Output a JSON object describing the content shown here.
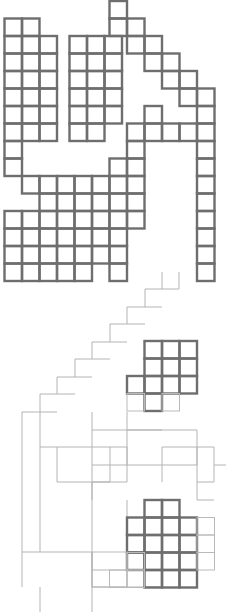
{
  "figure": {
    "type": "grid-diagram",
    "canvas": {
      "width": 226,
      "height": 612,
      "background": "#ffffff"
    },
    "grid": {
      "cell_size": 17.5,
      "origin_x": 4.5,
      "origin_y": 1.0
    },
    "strokes": {
      "thick_color": "#6e6e6e",
      "thick_width": 2.4,
      "thin_color": "#b9b9b9",
      "thin_width": 1.0
    },
    "legend": {
      "thick_label": "dark cell outline",
      "thin_label": "light connector path"
    }
  },
  "chart_data": {
    "type": "heatmap",
    "xlabel": "",
    "ylabel": "",
    "grid": true,
    "legend": "none",
    "cell_size": 17.5,
    "origin": [
      4.5,
      1.0
    ],
    "columns": 13,
    "rows": 35,
    "note": "Cells are addressed by [col,row] on a 17.5px pitch. weight 2 = thick dark outline, weight 1 = thin light outline.",
    "cells_thick": [
      [
        2,
        0
      ],
      [
        6,
        0
      ],
      [
        0,
        1
      ],
      [
        1,
        1
      ],
      [
        2,
        1
      ],
      [
        7,
        1
      ],
      [
        0,
        2
      ],
      [
        1,
        2
      ],
      [
        2,
        2
      ],
      [
        3,
        2
      ],
      [
        8,
        2
      ],
      [
        0,
        3
      ],
      [
        1,
        3
      ],
      [
        2,
        3
      ],
      [
        3,
        3
      ],
      [
        4,
        3
      ],
      [
        5,
        3
      ],
      [
        6,
        3
      ],
      [
        9,
        3
      ],
      [
        0,
        4
      ],
      [
        1,
        4
      ],
      [
        2,
        4
      ],
      [
        3,
        4
      ],
      [
        4,
        4
      ],
      [
        5,
        4
      ],
      [
        6,
        4
      ],
      [
        10,
        4
      ],
      [
        11,
        4
      ],
      [
        0,
        5
      ],
      [
        1,
        5
      ],
      [
        2,
        5
      ],
      [
        3,
        5
      ],
      [
        4,
        5
      ],
      [
        5,
        5
      ],
      [
        6,
        5
      ],
      [
        11,
        5
      ],
      [
        12,
        5
      ],
      [
        3,
        6
      ],
      [
        4,
        6
      ],
      [
        5,
        6
      ],
      [
        6,
        6
      ],
      [
        8,
        6
      ],
      [
        11,
        6
      ],
      [
        12,
        6
      ],
      [
        8,
        7
      ],
      [
        9,
        7
      ],
      [
        10,
        7
      ],
      [
        11,
        7
      ],
      [
        12,
        7
      ],
      [
        0,
        8
      ],
      [
        7,
        8
      ],
      [
        11,
        8
      ],
      [
        0,
        9
      ],
      [
        11,
        9
      ],
      [
        0,
        10
      ],
      [
        1,
        10
      ],
      [
        2,
        10
      ],
      [
        3,
        10
      ],
      [
        4,
        10
      ],
      [
        5,
        10
      ],
      [
        6,
        10
      ],
      [
        7,
        10
      ],
      [
        11,
        10
      ],
      [
        1,
        11
      ],
      [
        2,
        11
      ],
      [
        3,
        11
      ],
      [
        4,
        11
      ],
      [
        5,
        11
      ],
      [
        6,
        11
      ],
      [
        7,
        11
      ],
      [
        11,
        11
      ],
      [
        0,
        12
      ],
      [
        1,
        12
      ],
      [
        2,
        12
      ],
      [
        3,
        12
      ],
      [
        4,
        12
      ],
      [
        5,
        12
      ],
      [
        6,
        12
      ],
      [
        7,
        12
      ],
      [
        11,
        12
      ],
      [
        0,
        13
      ],
      [
        1,
        13
      ],
      [
        2,
        13
      ],
      [
        3,
        13
      ],
      [
        4,
        13
      ],
      [
        5,
        13
      ],
      [
        6,
        13
      ],
      [
        7,
        13
      ],
      [
        11,
        13
      ],
      [
        0,
        14
      ],
      [
        1,
        14
      ],
      [
        2,
        14
      ],
      [
        3,
        14
      ],
      [
        4,
        14
      ],
      [
        5,
        14
      ],
      [
        6,
        14
      ],
      [
        7,
        14
      ],
      [
        11,
        14
      ],
      [
        0,
        15
      ],
      [
        1,
        15
      ],
      [
        2,
        15
      ],
      [
        3,
        15
      ],
      [
        4,
        15
      ],
      [
        5,
        15
      ],
      [
        7,
        15
      ],
      [
        11,
        15
      ],
      [
        8,
        20
      ],
      [
        9,
        20
      ],
      [
        10,
        20
      ],
      [
        8,
        21
      ],
      [
        9,
        21
      ],
      [
        10,
        21
      ],
      [
        7,
        22
      ],
      [
        8,
        22
      ],
      [
        9,
        22
      ],
      [
        10,
        22
      ],
      [
        8,
        23
      ],
      [
        7,
        29
      ],
      [
        8,
        29
      ],
      [
        6,
        30
      ],
      [
        7,
        30
      ],
      [
        8,
        30
      ],
      [
        9,
        30
      ],
      [
        6,
        31
      ],
      [
        7,
        31
      ],
      [
        8,
        31
      ],
      [
        9,
        31
      ],
      [
        6,
        32
      ],
      [
        7,
        32
      ],
      [
        8,
        32
      ],
      [
        9,
        32
      ],
      [
        7,
        33
      ],
      [
        8,
        33
      ],
      [
        9,
        33
      ]
    ],
    "cells_thin": [
      [
        9,
        17
      ],
      [
        8,
        18
      ],
      [
        7,
        19
      ],
      [
        6,
        20
      ],
      [
        5,
        21
      ],
      [
        4,
        22
      ],
      [
        3,
        23
      ],
      [
        2,
        24
      ],
      [
        5,
        25
      ],
      [
        1,
        30
      ],
      [
        5,
        30
      ],
      [
        11,
        26
      ],
      [
        12,
        26
      ]
    ],
    "paths_thin": [
      "staircase descending from upper-right toward lower-left",
      "long vertical spine at left with hooks",
      "horizontal connector bridging left spine to right blocks"
    ]
  }
}
